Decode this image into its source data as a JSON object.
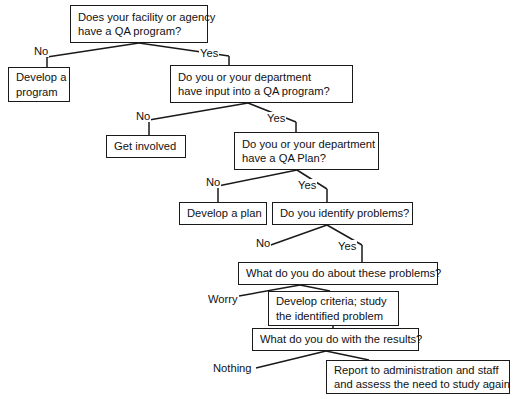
{
  "diagram": {
    "stroke_color": "#1a1a1a",
    "text_color": "#111111",
    "background": "#ffffff",
    "nodes": [
      {
        "id": "q1",
        "name": "question-facility-qa-program",
        "lines": [
          "Does your facility or agency",
          "have a QA program?"
        ],
        "x": 70,
        "y": 5,
        "w": 138,
        "h": 38
      },
      {
        "id": "a1no",
        "name": "action-develop-a-program",
        "lines": [
          "Develop a",
          "program"
        ],
        "x": 8,
        "y": 67,
        "w": 62,
        "h": 35
      },
      {
        "id": "q2",
        "name": "question-department-input",
        "lines": [
          "Do you or your department",
          "have input into a QA program?"
        ],
        "x": 170,
        "y": 65,
        "w": 183,
        "h": 38
      },
      {
        "id": "a2no",
        "name": "action-get-involved",
        "lines": [
          "Get involved"
        ],
        "x": 106,
        "y": 135,
        "w": 80,
        "h": 23
      },
      {
        "id": "q3",
        "name": "question-department-qa-plan",
        "lines": [
          "Do you or your department",
          "have a QA Plan?"
        ],
        "x": 234,
        "y": 132,
        "w": 145,
        "h": 38
      },
      {
        "id": "a3no",
        "name": "action-develop-a-plan",
        "lines": [
          "Develop a plan"
        ],
        "x": 179,
        "y": 202,
        "w": 88,
        "h": 23
      },
      {
        "id": "q4",
        "name": "question-identify-problems",
        "lines": [
          "Do you identify problems?"
        ],
        "x": 272,
        "y": 202,
        "w": 141,
        "h": 23
      },
      {
        "id": "q5",
        "name": "question-about-these-problems",
        "lines": [
          "What do you do about these problems?"
        ],
        "x": 238,
        "y": 262,
        "w": 200,
        "h": 23
      },
      {
        "id": "a5yes",
        "name": "action-develop-criteria-study",
        "lines": [
          "Develop criteria; study",
          "the identified problem"
        ],
        "x": 268,
        "y": 291,
        "w": 131,
        "h": 35
      },
      {
        "id": "q6",
        "name": "question-with-the-results",
        "lines": [
          "What do you do with the results?"
        ],
        "x": 252,
        "y": 328,
        "w": 167,
        "h": 23
      },
      {
        "id": "a6yes",
        "name": "action-report-to-administration",
        "lines": [
          "Report to administration and staff",
          "and assess the need to study again"
        ],
        "x": 326,
        "y": 360,
        "w": 184,
        "h": 34
      }
    ],
    "edge_labels": [
      {
        "id": "l1",
        "name": "edge-label-no-1",
        "text": "No",
        "x": 33,
        "y": 45
      },
      {
        "id": "l2",
        "name": "edge-label-yes-1",
        "text": "Yes",
        "x": 199,
        "y": 47
      },
      {
        "id": "l3",
        "name": "edge-label-no-2",
        "text": "No",
        "x": 135,
        "y": 110
      },
      {
        "id": "l4",
        "name": "edge-label-yes-2",
        "text": "Yes",
        "x": 266,
        "y": 112
      },
      {
        "id": "l5",
        "name": "edge-label-no-3",
        "text": "No",
        "x": 205,
        "y": 176
      },
      {
        "id": "l6",
        "name": "edge-label-yes-3",
        "text": "Yes",
        "x": 297,
        "y": 179
      },
      {
        "id": "l7",
        "name": "edge-label-no-4",
        "text": "No",
        "x": 255,
        "y": 237
      },
      {
        "id": "l8",
        "name": "edge-label-yes-4",
        "text": "Yes",
        "x": 337,
        "y": 240
      },
      {
        "id": "l9",
        "name": "edge-label-worry",
        "text": "Worry",
        "x": 207,
        "y": 293
      },
      {
        "id": "l10",
        "name": "edge-label-nothing",
        "text": "Nothing",
        "x": 212,
        "y": 362
      }
    ],
    "edges": [
      {
        "from": "q1",
        "to": "a1no",
        "label": "No",
        "path": "M 139 43 L 47 57 M 47 57 L 47 67",
        "name": "edge-q1-no"
      },
      {
        "from": "q1",
        "to": "q2",
        "label": "Yes",
        "path": "M 139 43 L 229 56 M 229 56 L 229 65",
        "name": "edge-q1-yes"
      },
      {
        "from": "q2",
        "to": "a2no",
        "label": "No",
        "path": "M 248 103 L 149 120 M 149 120 L 149 135",
        "name": "edge-q2-no"
      },
      {
        "from": "q2",
        "to": "q3",
        "label": "Yes",
        "path": "M 248 103 L 296 122 M 296 122 L 296 132",
        "name": "edge-q2-yes"
      },
      {
        "from": "q3",
        "to": "a3no",
        "label": "No",
        "path": "M 297 170 L 218 186 M 218 186 L 218 202",
        "name": "edge-q3-no"
      },
      {
        "from": "q3",
        "to": "q4",
        "label": "Yes",
        "path": "M 297 170 L 327 189 M 327 189 L 327 202",
        "name": "edge-q3-yes"
      },
      {
        "from": "q4",
        "to": "none",
        "label": "No",
        "path": "M 327 225 L 268 246",
        "name": "edge-q4-no"
      },
      {
        "from": "q4",
        "to": "q5",
        "label": "Yes",
        "path": "M 327 225 L 362 245 M 362 245 L 362 262",
        "name": "edge-q4-yes"
      },
      {
        "from": "q5",
        "to": "worry",
        "label": "Worry",
        "path": "M 300 285 L 239 296",
        "name": "edge-q5-worry"
      },
      {
        "from": "q5",
        "to": "a5yes",
        "label": "",
        "path": "M 300 285 L 330 291",
        "name": "edge-q5-study"
      },
      {
        "from": "a5yes",
        "to": "q6",
        "label": "",
        "path": "M 333 326 L 333 328",
        "name": "edge-study-results"
      },
      {
        "from": "q6",
        "to": "nothing",
        "label": "Nothing",
        "path": "M 326 351 L 256 368",
        "name": "edge-q6-nothing"
      },
      {
        "from": "q6",
        "to": "a6yes",
        "label": "",
        "path": "M 326 351 L 369 360",
        "name": "edge-q6-report"
      }
    ]
  }
}
